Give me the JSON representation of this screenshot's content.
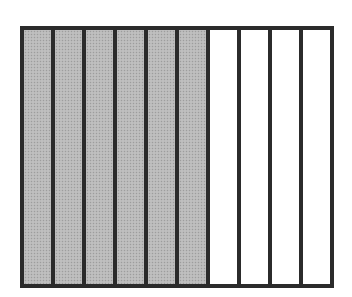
{
  "diagram": {
    "type": "fraction-bar",
    "total_parts": 10,
    "shaded_parts": 6,
    "fraction": "6/10",
    "orientation": "vertical-strips",
    "colors": {
      "border": "#2b2b2b",
      "shaded": "#b9b9b9",
      "unshaded": "#ffffff"
    },
    "parts": [
      {
        "index": 1,
        "shaded": true
      },
      {
        "index": 2,
        "shaded": true
      },
      {
        "index": 3,
        "shaded": true
      },
      {
        "index": 4,
        "shaded": true
      },
      {
        "index": 5,
        "shaded": true
      },
      {
        "index": 6,
        "shaded": true
      },
      {
        "index": 7,
        "shaded": false
      },
      {
        "index": 8,
        "shaded": false
      },
      {
        "index": 9,
        "shaded": false
      },
      {
        "index": 10,
        "shaded": false
      }
    ]
  }
}
